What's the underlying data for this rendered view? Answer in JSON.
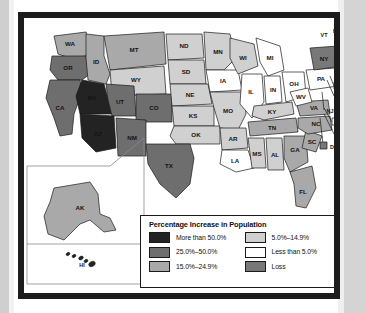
{
  "figure": {
    "kind": "choropleth-map",
    "region": "United States"
  },
  "legend": {
    "title": "Percentage Increase in Population",
    "columns": [
      [
        {
          "label": "More than 50.0%",
          "color": "#232323"
        },
        {
          "label": "25.0%–50.0%",
          "color": "#6e6e6e"
        },
        {
          "label": "15.0%–24.9%",
          "color": "#a9a9a9"
        }
      ],
      [
        {
          "label": "5.0%–14.9%",
          "color": "#d0d0d0"
        },
        {
          "label": "Less than 5.0%",
          "color": "#ffffff"
        },
        {
          "label": "Loss",
          "color": "#787878"
        }
      ]
    ]
  },
  "chart_data": {
    "type": "map",
    "title": "Percentage Increase in Population",
    "categories": [
      "More than 50.0%",
      "25.0%–50.0%",
      "15.0%–24.9%",
      "5.0%–14.9%",
      "Less than 5.0%",
      "Loss"
    ],
    "palette": {
      "More than 50.0%": "#232323",
      "25.0%–50.0%": "#6e6e6e",
      "15.0%–24.9%": "#a9a9a9",
      "5.0%–14.9%": "#d0d0d0",
      "Less than 5.0%": "#ffffff",
      "Loss": "#787878"
    },
    "states": [
      {
        "code": "WA",
        "category": "15.0%–24.9%"
      },
      {
        "code": "OR",
        "category": "25.0%–50.0%"
      },
      {
        "code": "CA",
        "category": "25.0%–50.0%"
      },
      {
        "code": "ID",
        "category": "15.0%–24.9%"
      },
      {
        "code": "NV",
        "category": "More than 50.0%"
      },
      {
        "code": "MT",
        "category": "15.0%–24.9%"
      },
      {
        "code": "WY",
        "category": "5.0%–14.9%"
      },
      {
        "code": "UT",
        "category": "25.0%–50.0%"
      },
      {
        "code": "AZ",
        "category": "More than 50.0%"
      },
      {
        "code": "CO",
        "category": "25.0%–50.0%"
      },
      {
        "code": "NM",
        "category": "25.0%–50.0%"
      },
      {
        "code": "ND",
        "category": "5.0%–14.9%"
      },
      {
        "code": "SD",
        "category": "5.0%–14.9%"
      },
      {
        "code": "NE",
        "category": "5.0%–14.9%"
      },
      {
        "code": "KS",
        "category": "5.0%–14.9%"
      },
      {
        "code": "OK",
        "category": "5.0%–14.9%"
      },
      {
        "code": "TX",
        "category": "25.0%–50.0%"
      },
      {
        "code": "MN",
        "category": "5.0%–14.9%"
      },
      {
        "code": "IA",
        "category": "Less than 5.0%"
      },
      {
        "code": "MO",
        "category": "5.0%–14.9%"
      },
      {
        "code": "AR",
        "category": "5.0%–14.9%"
      },
      {
        "code": "LA",
        "category": "Less than 5.0%"
      },
      {
        "code": "WI",
        "category": "5.0%–14.9%"
      },
      {
        "code": "IL",
        "category": "Less than 5.0%"
      },
      {
        "code": "MI",
        "category": "Less than 5.0%"
      },
      {
        "code": "IN",
        "category": "Less than 5.0%"
      },
      {
        "code": "OH",
        "category": "Less than 5.0%"
      },
      {
        "code": "KY",
        "category": "5.0%–14.9%"
      },
      {
        "code": "TN",
        "category": "15.0%–24.9%"
      },
      {
        "code": "MS",
        "category": "5.0%–14.9%"
      },
      {
        "code": "AL",
        "category": "5.0%–14.9%"
      },
      {
        "code": "GA",
        "category": "15.0%–24.9%"
      },
      {
        "code": "FL",
        "category": "15.0%–24.9%"
      },
      {
        "code": "SC",
        "category": "15.0%–24.9%"
      },
      {
        "code": "NC",
        "category": "15.0%–24.9%"
      },
      {
        "code": "VA",
        "category": "15.0%–24.9%"
      },
      {
        "code": "WV",
        "category": "Less than 5.0%"
      },
      {
        "code": "PA",
        "category": "Less than 5.0%"
      },
      {
        "code": "NY",
        "category": "Loss"
      },
      {
        "code": "VT",
        "category": "5.0%–14.9%"
      },
      {
        "code": "NH",
        "category": "5.0%–14.9%"
      },
      {
        "code": "ME",
        "category": "5.0%–14.9%"
      },
      {
        "code": "MA",
        "category": "Less than 5.0%"
      },
      {
        "code": "RI",
        "category": "5.0%–14.9%"
      },
      {
        "code": "CT",
        "category": "Less than 5.0%"
      },
      {
        "code": "NJ",
        "category": "5.0%–14.9%"
      },
      {
        "code": "DE",
        "category": "Less than 5.0%"
      },
      {
        "code": "MD",
        "category": "5.0%–14.9%"
      },
      {
        "code": "DC",
        "category": "Loss"
      },
      {
        "code": "AK",
        "category": "15.0%–24.9%"
      },
      {
        "code": "HI",
        "category": "More than 50.0%"
      }
    ],
    "insets": [
      "AK",
      "HI"
    ],
    "callouts": [
      "VT",
      "NH",
      "MA",
      "RI",
      "CT",
      "NJ",
      "DE",
      "MD",
      "DC"
    ]
  }
}
